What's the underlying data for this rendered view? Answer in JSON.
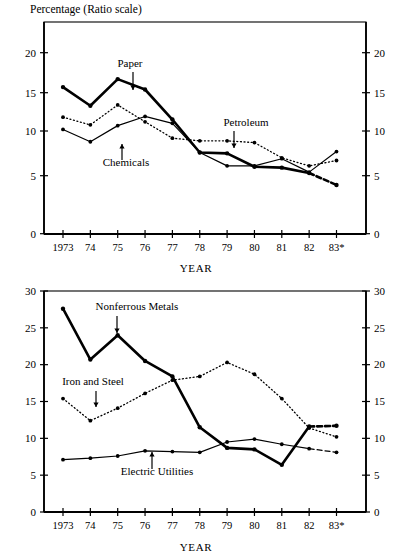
{
  "figure": {
    "background": "#ffffff",
    "ink": "#000000"
  },
  "charts": [
    {
      "id": "top-chart",
      "title": "Percentage (Ratio scale)",
      "xlabel": "YEAR"
    },
    {
      "id": "bottom-chart",
      "title": "",
      "xlabel": "YEAR"
    }
  ],
  "chart_data": [
    {
      "type": "line",
      "title": "Percentage (Ratio scale)",
      "subtitle": "",
      "xlabel": "YEAR",
      "ylabel": "Percentage (Ratio scale)",
      "scale": "ratio",
      "grid": false,
      "legend": "annotations-with-arrows",
      "x": [
        1973,
        1974,
        1975,
        1976,
        1977,
        1978,
        1979,
        1980,
        1981,
        1982,
        1983
      ],
      "categories": [
        "1973",
        "74",
        "75",
        "76",
        "77",
        "78",
        "79",
        "80",
        "81",
        "82",
        "83*"
      ],
      "ytick_labels": [
        "0",
        "5",
        "10",
        "15",
        "20"
      ],
      "ytick_values": [
        0,
        5,
        10,
        15,
        20
      ],
      "ylim": [
        0,
        23
      ],
      "right_axis": true,
      "right_ytick_labels": [
        "0",
        "5",
        "10",
        "15",
        "20"
      ],
      "series": [
        {
          "name": "Paper",
          "style": "thick-solid",
          "marker": "dot",
          "last_segment_style": "dashed",
          "values": [
            15.7,
            13.3,
            16.7,
            15.4,
            11.5,
            7.6,
            7.5,
            6.0,
            5.9,
            5.3,
            4.2
          ]
        },
        {
          "name": "Chemicals",
          "style": "thin-solid",
          "marker": "dot",
          "values": [
            10.2,
            8.8,
            10.7,
            11.9,
            11.0,
            7.6,
            6.1,
            6.1,
            6.9,
            5.4,
            7.7
          ]
        },
        {
          "name": "Petroleum",
          "style": "dotted",
          "marker": "dot",
          "values": [
            11.8,
            10.8,
            13.4,
            11.2,
            9.2,
            8.9,
            8.9,
            8.7,
            7.0,
            6.1,
            6.7
          ]
        }
      ],
      "annotations": [
        {
          "label": "Paper",
          "point_year": "1975-76",
          "arrow": "down"
        },
        {
          "label": "Chemicals",
          "point_year": "1975",
          "arrow": "up"
        },
        {
          "label": "Petroleum",
          "point_year": "1979",
          "arrow": "down"
        }
      ]
    },
    {
      "type": "line",
      "title": "",
      "subtitle": "",
      "xlabel": "YEAR",
      "ylabel": "",
      "scale": "linear",
      "grid": false,
      "legend": "annotations-with-arrows",
      "x": [
        1973,
        1974,
        1975,
        1976,
        1977,
        1978,
        1979,
        1980,
        1981,
        1982,
        1983
      ],
      "categories": [
        "1973",
        "74",
        "75",
        "76",
        "77",
        "78",
        "79",
        "80",
        "81",
        "82",
        "83*"
      ],
      "ytick_labels": [
        "0",
        "5",
        "10",
        "15",
        "20",
        "25",
        "30"
      ],
      "ytick_values": [
        0,
        5,
        10,
        15,
        20,
        25,
        30
      ],
      "ylim": [
        0,
        30
      ],
      "right_axis": true,
      "right_ytick_labels": [
        "0",
        "5",
        "10",
        "15",
        "20",
        "25",
        "30"
      ],
      "series": [
        {
          "name": "Nonferrous Metals",
          "style": "thick-solid",
          "marker": "dot",
          "last_segment_style": "dashed",
          "values": [
            27.6,
            20.7,
            24.0,
            20.5,
            18.4,
            11.5,
            8.7,
            8.5,
            6.4,
            11.6,
            11.7
          ]
        },
        {
          "name": "Iron and Steel",
          "style": "dotted",
          "marker": "dot",
          "values": [
            15.4,
            12.4,
            14.1,
            16.1,
            17.9,
            18.4,
            20.3,
            18.7,
            15.4,
            11.4,
            10.2
          ]
        },
        {
          "name": "Electric Utilities",
          "style": "thin-solid",
          "marker": "dot",
          "last_segment_style": "dashed",
          "values": [
            7.1,
            7.3,
            7.6,
            8.3,
            8.2,
            8.1,
            9.5,
            9.9,
            9.2,
            8.6,
            8.1
          ]
        }
      ],
      "annotations": [
        {
          "label": "Nonferrous Metals",
          "point_year": "1975",
          "arrow": "down"
        },
        {
          "label": "Iron and Steel",
          "point_year": "1974",
          "arrow": "down"
        },
        {
          "label": "Electric Utilities",
          "point_year": "1976",
          "arrow": "up"
        }
      ]
    }
  ]
}
